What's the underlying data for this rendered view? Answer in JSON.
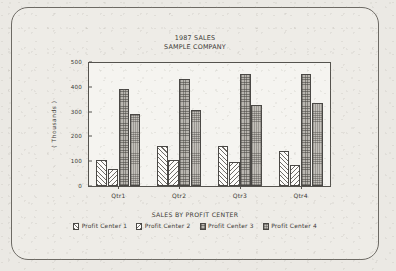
{
  "chart_data": {
    "type": "bar",
    "title": "1987 SALES",
    "subtitle": "SAMPLE COMPANY",
    "footer_title": "SALES BY PROFIT CENTER",
    "xlabel": "",
    "ylabel": "( Thousands )",
    "ylim": [
      0,
      500
    ],
    "yticks": [
      0,
      100,
      200,
      300,
      400,
      500
    ],
    "grid": false,
    "legend_position": "bottom",
    "categories": [
      "Qtr1",
      "Qtr2",
      "Qtr3",
      "Qtr4"
    ],
    "series": [
      {
        "name": "Profit Center 1",
        "values": [
          105,
          160,
          162,
          140
        ],
        "pattern": "diagonal-hatch-forward"
      },
      {
        "name": "Profit Center 2",
        "values": [
          70,
          105,
          98,
          85
        ],
        "pattern": "diagonal-hatch-back"
      },
      {
        "name": "Profit Center 3",
        "values": [
          390,
          430,
          450,
          450
        ],
        "pattern": "dense-dotted-dark"
      },
      {
        "name": "Profit Center 4",
        "values": [
          290,
          305,
          328,
          333
        ],
        "pattern": "dense-dotted-light"
      }
    ]
  },
  "colors": {
    "page_background": "#ebe9e4",
    "frame_border": "#6d6a64",
    "axis": "#55534e",
    "text": "#3b3935",
    "series3_fill": "#b9b6b0",
    "series4_fill": "#c3c0ba"
  }
}
